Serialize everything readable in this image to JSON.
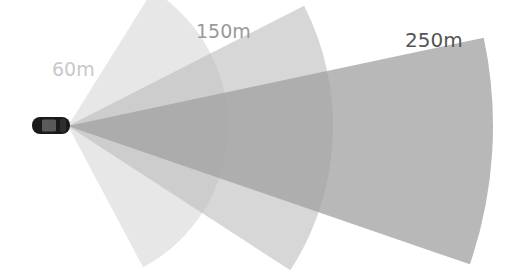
{
  "diagram": {
    "origin": {
      "x": 68,
      "y": 126
    },
    "ranges": [
      {
        "label": "60m",
        "distance_m": 60,
        "radius_px": 160,
        "start_angle_deg": -58,
        "end_angle_deg": 62,
        "color": "#d4d4d4",
        "opacity": 0.55,
        "label_color": "#c8c8c8"
      },
      {
        "label": "150m",
        "distance_m": 150,
        "radius_px": 265,
        "start_angle_deg": -27,
        "end_angle_deg": 33,
        "color": "#bdbdbd",
        "opacity": 0.6,
        "label_color": "#9a9a9a"
      },
      {
        "label": "250m",
        "distance_m": 250,
        "radius_px": 425,
        "start_angle_deg": -12,
        "end_angle_deg": 19,
        "color": "#a0a0a0",
        "opacity": 0.75,
        "label_color": "#555555"
      }
    ],
    "vehicle": {
      "name": "car",
      "color": "#1a1a1a",
      "roof_color": "#5a5a5a"
    }
  }
}
